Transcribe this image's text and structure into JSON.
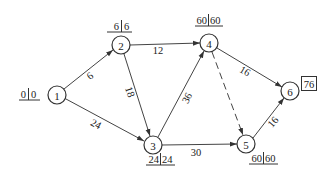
{
  "diagram": {
    "type": "activity-network",
    "nodes": [
      {
        "id": "1",
        "label": "1",
        "x": 57,
        "y": 95
      },
      {
        "id": "2",
        "label": "2",
        "x": 121,
        "y": 45
      },
      {
        "id": "3",
        "label": "3",
        "x": 153,
        "y": 145
      },
      {
        "id": "4",
        "label": "4",
        "x": 209,
        "y": 43
      },
      {
        "id": "5",
        "label": "5",
        "x": 246,
        "y": 144
      },
      {
        "id": "6",
        "label": "6",
        "x": 290,
        "y": 91
      }
    ],
    "edges": [
      {
        "from": "1",
        "to": "2",
        "weight": "6",
        "dashed": false
      },
      {
        "from": "1",
        "to": "3",
        "weight": "24",
        "dashed": false
      },
      {
        "from": "2",
        "to": "4",
        "weight": "12",
        "dashed": false
      },
      {
        "from": "2",
        "to": "3",
        "weight": "18",
        "dashed": false
      },
      {
        "from": "3",
        "to": "4",
        "weight": "36",
        "dashed": false
      },
      {
        "from": "3",
        "to": "5",
        "weight": "30",
        "dashed": false
      },
      {
        "from": "4",
        "to": "6",
        "weight": "16",
        "dashed": false
      },
      {
        "from": "4",
        "to": "5",
        "weight": "",
        "dashed": true
      },
      {
        "from": "5",
        "to": "6",
        "weight": "16",
        "dashed": false
      }
    ],
    "time_labels": [
      {
        "node": "1",
        "left": "0",
        "right": "0"
      },
      {
        "node": "2",
        "left": "6",
        "right": "6"
      },
      {
        "node": "4",
        "left": "60",
        "right": "60"
      },
      {
        "node": "3",
        "left": "24",
        "right": "24"
      },
      {
        "node": "5",
        "left": "60",
        "right": "60"
      }
    ],
    "final_box": {
      "node": "6",
      "value": "76"
    }
  }
}
